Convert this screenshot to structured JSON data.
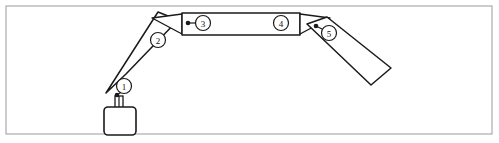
{
  "figure": {
    "background_color": "#ffffff",
    "frame": {
      "name": "figure-border",
      "stroke_color": "#9a9a9a",
      "x": 6,
      "y": 6,
      "width": 486,
      "height": 128
    },
    "line_color": "#1a1a1a"
  },
  "callouts": [
    {
      "id": "1",
      "label": "1",
      "circle": {
        "cx": 124,
        "cy": 86,
        "r": 7.5
      },
      "dot": {
        "cx": 117,
        "cy": 95
      },
      "leader": {
        "x1": 117,
        "y1": 95,
        "x2": 122.5,
        "y2": 91
      }
    },
    {
      "id": "2",
      "label": "2",
      "circle": {
        "cx": 158,
        "cy": 40,
        "r": 7.5
      },
      "dot": null,
      "leader": null
    },
    {
      "id": "3",
      "label": "3",
      "circle": {
        "cx": 203,
        "cy": 23,
        "r": 7.5
      },
      "dot": {
        "cx": 188,
        "cy": 23
      },
      "leader": {
        "x1": 188,
        "y1": 23,
        "x2": 195.5,
        "y2": 23
      }
    },
    {
      "id": "4",
      "label": "4",
      "circle": {
        "cx": 281,
        "cy": 23,
        "r": 7.5
      },
      "dot": null,
      "leader": null
    },
    {
      "id": "5",
      "label": "5",
      "circle": {
        "cx": 329,
        "cy": 33,
        "r": 7.5
      },
      "dot": {
        "cx": 316,
        "cy": 26
      },
      "leader": {
        "x1": 316,
        "y1": 26,
        "x2": 324,
        "y2": 30
      }
    }
  ],
  "links": {
    "left_rocker": {
      "name": "left-rocker-link",
      "points": "106,93 126,74 178,20 158,12"
    },
    "coupler_bar": {
      "name": "horizontal-coupler-bar",
      "x": 182,
      "y": 13,
      "width": 118,
      "height": 22
    },
    "right_rocker": {
      "name": "right-rocker-link",
      "points": "307,24 327,17 391,68 371,85"
    }
  },
  "joints": {
    "left_pivot_triangle": {
      "name": "left-pivot-joint",
      "points": "182,14 182,34 152,18"
    },
    "right_pivot_triangle": {
      "name": "right-pivot-joint",
      "points": "300,14 300,34 330,18"
    }
  },
  "ground": {
    "post": {
      "name": "ground-post",
      "x": 115,
      "y": 96,
      "width": 8,
      "height": 12
    },
    "block": {
      "name": "ground-base-block",
      "x": 104,
      "y": 107,
      "width": 32,
      "height": 28,
      "rx": 4
    }
  }
}
